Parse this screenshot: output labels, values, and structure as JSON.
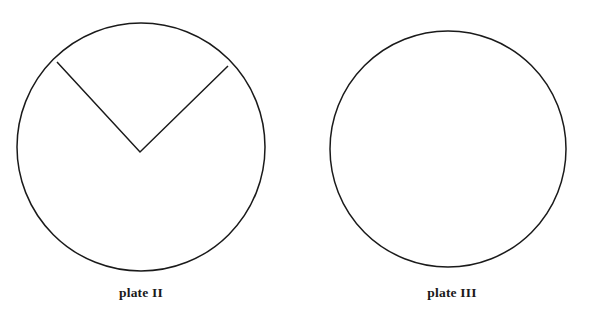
{
  "figure": {
    "background_color": "#ffffff",
    "stroke_color": "#1a1a1a",
    "stroke_width": 1.5,
    "width": 593,
    "height": 320
  },
  "plates": [
    {
      "id": "plate-ii",
      "label": "plate II",
      "shape": "circle-with-wedge-removed",
      "circle": {
        "cx": 141,
        "cy": 147,
        "r": 124
      },
      "wedge": {
        "apex": {
          "x": 140,
          "y": 152
        },
        "arc_start": {
          "x": 57,
          "y": 62
        },
        "arc_end": {
          "x": 228,
          "y": 66
        },
        "description": "V-shaped notch formed by two radii drawn from the center up to the upper-left and upper-right arc"
      },
      "label_position": {
        "x": 141,
        "y": 293
      }
    },
    {
      "id": "plate-iii",
      "label": "plate III",
      "shape": "circle",
      "circle": {
        "cx": 448,
        "cy": 149,
        "r": 118
      },
      "wedge": null,
      "label_position": {
        "x": 452,
        "y": 293
      }
    }
  ]
}
